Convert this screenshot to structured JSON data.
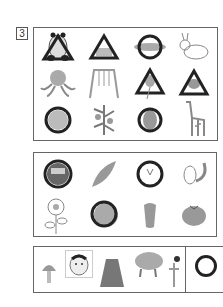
{
  "question": {
    "number": "3"
  },
  "section1": {
    "items": [
      {
        "name": "panda",
        "mark": "triangle"
      },
      {
        "name": "sandbox",
        "mark": "triangle"
      },
      {
        "name": "fish",
        "mark": "circle"
      },
      {
        "name": "rabbit",
        "mark": "none"
      },
      {
        "name": "octopus",
        "mark": "none"
      },
      {
        "name": "swing",
        "mark": "none"
      },
      {
        "name": "balloon",
        "mark": "triangle"
      },
      {
        "name": "squirrel",
        "mark": "triangle"
      },
      {
        "name": "hippo",
        "mark": "circle"
      },
      {
        "name": "flower-plant",
        "mark": "none"
      },
      {
        "name": "owl",
        "mark": "circle"
      },
      {
        "name": "giraffe",
        "mark": "none"
      }
    ]
  },
  "section2": {
    "items": [
      {
        "name": "daruma",
        "mark": "circle"
      },
      {
        "name": "sweet-potato",
        "mark": "none"
      },
      {
        "name": "chestnut",
        "mark": "circle"
      },
      {
        "name": "chipmunk",
        "mark": "none"
      },
      {
        "name": "sunflower",
        "mark": "none"
      },
      {
        "name": "bear",
        "mark": "circle"
      },
      {
        "name": "bell-pepper",
        "mark": "none"
      },
      {
        "name": "tomato",
        "mark": "none"
      }
    ]
  },
  "section3": {
    "items": [
      {
        "name": "mushroom"
      },
      {
        "name": "okame-mask"
      },
      {
        "name": "hakama"
      },
      {
        "name": "boar"
      },
      {
        "name": "kendama"
      }
    ],
    "answer_mark": "circle"
  },
  "colors": {
    "border": "#666666",
    "mark": "#222222",
    "item": "#888888"
  }
}
